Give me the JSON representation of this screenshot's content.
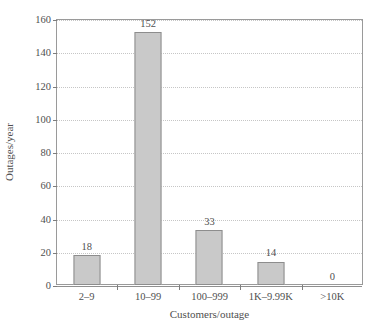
{
  "chart_data": {
    "type": "bar",
    "title": "",
    "xlabel": "Customers/outage",
    "ylabel": "Outages/year",
    "categories": [
      "2–9",
      "10–99",
      "100–999",
      "1K–9.99K",
      ">10K"
    ],
    "values": [
      18,
      152,
      33,
      14,
      0
    ],
    "value_labels": [
      "18",
      "152",
      "33",
      "14",
      "0"
    ],
    "ylim": [
      0,
      160
    ],
    "ytick_values": [
      0,
      20,
      40,
      60,
      80,
      100,
      120,
      140,
      160
    ],
    "ytick_labels": [
      "0",
      "20",
      "40",
      "60",
      "80",
      "100",
      "120",
      "140",
      "160"
    ],
    "grid": true,
    "grid_axis": "y",
    "grid_style": "dotted",
    "legend": false,
    "legend_position": "none",
    "series": [
      {
        "name": "Outages/year",
        "values": [
          18,
          152,
          33,
          14,
          0
        ]
      }
    ],
    "colors": {
      "bar_fill": "#c9c9c9",
      "bar_border": "#8d8d8d",
      "grid": "#c6c6c6",
      "axis": "#8f8f8f",
      "frame": "#9a9a9a",
      "text": "#4f4f4f",
      "background": "#ffffff"
    }
  },
  "artifact": {
    "bottom_left_mark": ""
  }
}
